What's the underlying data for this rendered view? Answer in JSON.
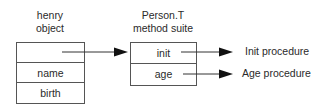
{
  "object": {
    "title_line1": "henry",
    "title_line2": "object",
    "cells": [
      "",
      "name",
      "birth"
    ]
  },
  "suite": {
    "title_line1": "Person.T",
    "title_line2": "method suite",
    "cells": [
      "init",
      "age"
    ]
  },
  "procedures": [
    "Init procedure",
    "Age procedure"
  ],
  "colors": {
    "line": "#555555",
    "arrow": "#111111",
    "text": "#2a2a2a"
  }
}
